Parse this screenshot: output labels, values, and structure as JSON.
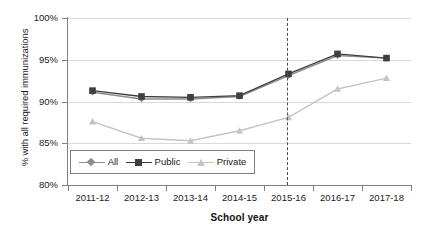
{
  "chart_data": {
    "type": "line",
    "title": "",
    "xlabel": "School year",
    "ylabel": "% with all required immunizations",
    "categories": [
      "2011-12",
      "2012-13",
      "2013-14",
      "2014-15",
      "2015-16",
      "2016-17",
      "2017-18"
    ],
    "series": [
      {
        "name": "All",
        "marker": "diamond",
        "color": "#8c8c8c",
        "values": [
          91.1,
          90.3,
          90.3,
          90.6,
          93.1,
          95.5,
          95.2
        ]
      },
      {
        "name": "Public",
        "marker": "square",
        "color": "#3f3f3f",
        "values": [
          91.3,
          90.6,
          90.5,
          90.7,
          93.3,
          95.7,
          95.2
        ]
      },
      {
        "name": "Private",
        "marker": "triangle",
        "color": "#c4c4c4",
        "values": [
          87.6,
          85.6,
          85.3,
          86.5,
          88.1,
          91.5,
          92.8
        ]
      }
    ],
    "ylim": [
      80,
      100
    ],
    "ytick_values": [
      80,
      85,
      90,
      95,
      100
    ],
    "ytick_labels": [
      "80%",
      "85%",
      "90%",
      "95%",
      "100%"
    ],
    "grid": true,
    "legend_position": "inside-bottom-left",
    "annotations": [
      {
        "type": "vertical-dashed-line",
        "at_category": "2015-16",
        "label": ""
      }
    ]
  },
  "legend": {
    "items": [
      {
        "label": "All"
      },
      {
        "label": "Public"
      },
      {
        "label": "Private"
      }
    ]
  },
  "colors": {
    "all": "#8c8c8c",
    "public": "#3f3f3f",
    "private": "#c4c4c4",
    "grid": "#d9d9d9",
    "axis": "#808080",
    "text": "#1a1a1a"
  }
}
